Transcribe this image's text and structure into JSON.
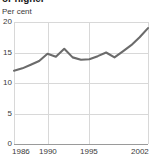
{
  "chart_data": {
    "type": "line",
    "title": "or higher",
    "subtitle": "",
    "xlabel": "",
    "ylabel": "Per cent",
    "ylim": [
      0,
      20
    ],
    "xlim": [
      1986,
      2002
    ],
    "grid": true,
    "legend": "none",
    "ytick_labels": [
      "20",
      "15",
      "10",
      "5",
      "0"
    ],
    "ytick_values": [
      20,
      15,
      10,
      5,
      0
    ],
    "xtick_labels": [
      "1986",
      "1990",
      "1995",
      "2002"
    ],
    "xtick_values": [
      1986,
      1990,
      1995,
      2002
    ],
    "line_color": "#6b6b6b",
    "grid_color": "#d8d8d8",
    "axis_color": "#9a9a9a",
    "background_color": "#ffffff",
    "x": [
      1986,
      1987,
      1988,
      1989,
      1990,
      1991,
      1992,
      1993,
      1994,
      1995,
      1996,
      1997,
      1998,
      1999,
      2000,
      2001,
      2002
    ],
    "series": [
      {
        "name": "Per cent",
        "values": [
          12.0,
          12.4,
          13.0,
          13.6,
          14.8,
          14.3,
          15.6,
          14.2,
          13.8,
          13.9,
          14.4,
          15.0,
          14.2,
          15.2,
          16.2,
          17.5,
          19.0
        ]
      }
    ]
  }
}
